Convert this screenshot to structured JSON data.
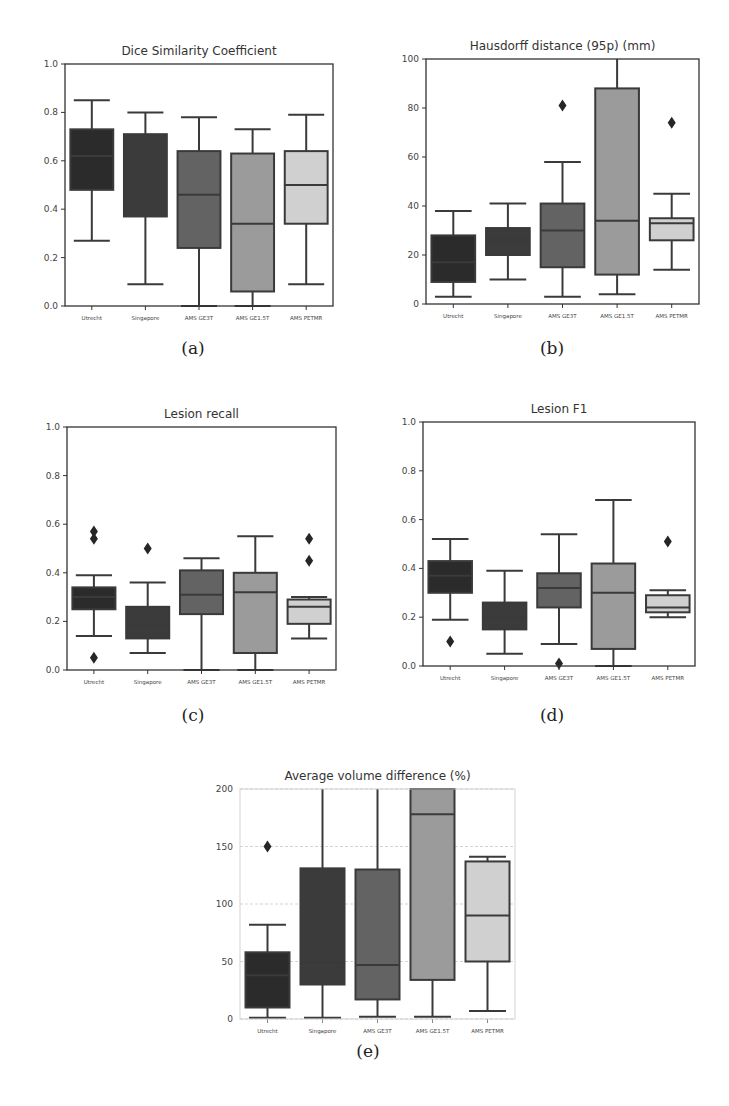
{
  "figure": {
    "captions": [
      "(a)",
      "(b)",
      "(c)",
      "(d)",
      "(e)"
    ]
  },
  "palette": {
    "Utrecht": "#2b2b2b",
    "Singapore": "#3b3b3b",
    "AMS GE3T": "#636363",
    "AMS GE1.5T": "#9b9b9b",
    "AMS PETMR": "#d0d0d0",
    "edge": "#3a3a3a"
  },
  "chart_data": [
    {
      "id": "a",
      "type": "box",
      "title": "Dice Similarity Coefficient",
      "caption": "(a)",
      "categories": [
        "Utrecht",
        "Singapore",
        "AMS GE3T",
        "AMS GE1.5T",
        "AMS PETMR"
      ],
      "ylim": [
        0,
        1.0
      ],
      "yticks": [
        0.0,
        0.2,
        0.4,
        0.6,
        0.8,
        1.0
      ],
      "ytick_labels": [
        "0.0",
        "0.2",
        "0.4",
        "0.6",
        "0.8",
        "1.0"
      ],
      "grid": false,
      "boxes": [
        {
          "whislo": 0.27,
          "q1": 0.48,
          "med": 0.62,
          "q3": 0.73,
          "whishi": 0.85,
          "fliers": []
        },
        {
          "whislo": 0.09,
          "q1": 0.37,
          "med": 0.62,
          "q3": 0.71,
          "whishi": 0.8,
          "fliers": []
        },
        {
          "whislo": 0.0,
          "q1": 0.24,
          "med": 0.46,
          "q3": 0.64,
          "whishi": 0.78,
          "fliers": []
        },
        {
          "whislo": 0.0,
          "q1": 0.06,
          "med": 0.34,
          "q3": 0.63,
          "whishi": 0.73,
          "fliers": []
        },
        {
          "whislo": 0.09,
          "q1": 0.34,
          "med": 0.5,
          "q3": 0.64,
          "whishi": 0.79,
          "fliers": []
        }
      ]
    },
    {
      "id": "b",
      "type": "box",
      "title": "Hausdorff distance (95p) (mm)",
      "caption": "(b)",
      "categories": [
        "Utrecht",
        "Singapore",
        "AMS GE3T",
        "AMS GE1.5T",
        "AMS PETMR"
      ],
      "ylim": [
        0,
        100
      ],
      "yticks": [
        0,
        20,
        40,
        60,
        80,
        100
      ],
      "ytick_labels": [
        "0",
        "20",
        "40",
        "60",
        "80",
        "100"
      ],
      "grid": false,
      "boxes": [
        {
          "whislo": 3,
          "q1": 9,
          "med": 17,
          "q3": 28,
          "whishi": 38,
          "fliers": []
        },
        {
          "whislo": 10,
          "q1": 20,
          "med": 26,
          "q3": 31,
          "whishi": 41,
          "fliers": []
        },
        {
          "whislo": 3,
          "q1": 15,
          "med": 30,
          "q3": 41,
          "whishi": 58,
          "fliers": [
            81
          ]
        },
        {
          "whislo": 4,
          "q1": 12,
          "med": 34,
          "q3": 88,
          "whishi": 100,
          "fliers": []
        },
        {
          "whislo": 14,
          "q1": 26,
          "med": 33,
          "q3": 35,
          "whishi": 45,
          "fliers": [
            74
          ]
        }
      ]
    },
    {
      "id": "c",
      "type": "box",
      "title": "Lesion recall",
      "caption": "(c)",
      "categories": [
        "Utrecht",
        "Singapore",
        "AMS GE3T",
        "AMS GE1.5T",
        "AMS PETMR"
      ],
      "ylim": [
        0,
        1.0
      ],
      "yticks": [
        0.0,
        0.2,
        0.4,
        0.6,
        0.8,
        1.0
      ],
      "ytick_labels": [
        "0.0",
        "0.2",
        "0.4",
        "0.6",
        "0.8",
        "1.0"
      ],
      "grid": false,
      "boxes": [
        {
          "whislo": 0.14,
          "q1": 0.25,
          "med": 0.3,
          "q3": 0.34,
          "whishi": 0.39,
          "fliers": [
            0.05,
            0.54,
            0.57
          ]
        },
        {
          "whislo": 0.07,
          "q1": 0.13,
          "med": 0.18,
          "q3": 0.26,
          "whishi": 0.36,
          "fliers": [
            0.5
          ]
        },
        {
          "whislo": 0.0,
          "q1": 0.23,
          "med": 0.31,
          "q3": 0.41,
          "whishi": 0.46,
          "fliers": []
        },
        {
          "whislo": 0.0,
          "q1": 0.07,
          "med": 0.32,
          "q3": 0.4,
          "whishi": 0.55,
          "fliers": []
        },
        {
          "whislo": 0.13,
          "q1": 0.19,
          "med": 0.26,
          "q3": 0.29,
          "whishi": 0.3,
          "fliers": [
            0.45,
            0.54
          ]
        }
      ]
    },
    {
      "id": "d",
      "type": "box",
      "title": "Lesion F1",
      "caption": "(d)",
      "categories": [
        "Utrecht",
        "Singapore",
        "AMS GE3T",
        "AMS GE1.5T",
        "AMS PETMR"
      ],
      "ylim": [
        0,
        1.0
      ],
      "yticks": [
        0.0,
        0.2,
        0.4,
        0.6,
        0.8,
        1.0
      ],
      "ytick_labels": [
        "0.0",
        "0.2",
        "0.4",
        "0.6",
        "0.8",
        "1.0"
      ],
      "grid": false,
      "boxes": [
        {
          "whislo": 0.19,
          "q1": 0.3,
          "med": 0.37,
          "q3": 0.43,
          "whishi": 0.52,
          "fliers": [
            0.1
          ]
        },
        {
          "whislo": 0.05,
          "q1": 0.15,
          "med": 0.2,
          "q3": 0.26,
          "whishi": 0.39,
          "fliers": []
        },
        {
          "whislo": 0.09,
          "q1": 0.24,
          "med": 0.32,
          "q3": 0.38,
          "whishi": 0.54,
          "fliers": [
            0.01
          ]
        },
        {
          "whislo": 0.0,
          "q1": 0.07,
          "med": 0.3,
          "q3": 0.42,
          "whishi": 0.68,
          "fliers": []
        },
        {
          "whislo": 0.2,
          "q1": 0.22,
          "med": 0.24,
          "q3": 0.29,
          "whishi": 0.31,
          "fliers": [
            0.51
          ]
        }
      ]
    },
    {
      "id": "e",
      "type": "box",
      "title": "Average volume difference (%)",
      "caption": "(e)",
      "categories": [
        "Utrecht",
        "Singapore",
        "AMS GE3T",
        "AMS GE1.5T",
        "AMS PETMR"
      ],
      "ylim": [
        0,
        200
      ],
      "yticks": [
        0,
        50,
        100,
        150,
        200
      ],
      "ytick_labels": [
        "0",
        "50",
        "100",
        "150",
        "200"
      ],
      "grid": true,
      "boxes": [
        {
          "whislo": 1,
          "q1": 10,
          "med": 38,
          "q3": 58,
          "whishi": 82,
          "fliers": [
            150
          ]
        },
        {
          "whislo": 1,
          "q1": 30,
          "med": 49,
          "q3": 131,
          "whishi": 200,
          "fliers": []
        },
        {
          "whislo": 2,
          "q1": 17,
          "med": 47,
          "q3": 130,
          "whishi": 200,
          "fliers": []
        },
        {
          "whislo": 2,
          "q1": 34,
          "med": 178,
          "q3": 200,
          "whishi": 200,
          "fliers": []
        },
        {
          "whislo": 7,
          "q1": 50,
          "med": 90,
          "q3": 137,
          "whishi": 141,
          "fliers": []
        }
      ]
    }
  ]
}
